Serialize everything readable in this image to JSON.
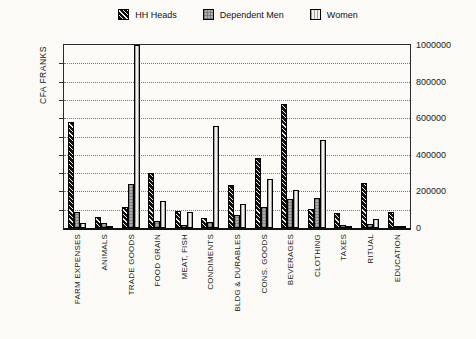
{
  "page": {
    "background": "#fbfaf7"
  },
  "legend": {
    "position": "top-center",
    "items": [
      {
        "label": "HH Heads",
        "swatch": "black-diagonal-hatch"
      },
      {
        "label": "Dependent Men",
        "swatch": "gray-checker"
      },
      {
        "label": "Women",
        "swatch": "light-vertical-lines"
      }
    ]
  },
  "chart_data": {
    "type": "bar",
    "title": "",
    "ylabel": "CFA FRANKS",
    "xlabel": "",
    "ylim": [
      0,
      1000000
    ],
    "gridline_step": 100000,
    "ytick_label_step": 200000,
    "ytick_labels_side": "right",
    "grid": "horizontal-dotted",
    "legend_position": "top-center",
    "x_label_rotation": -90,
    "categories": [
      "FARM EXPENSES",
      "ANIMALS",
      "TRADE GOODS",
      "FOOD GRAIN",
      "MEAT, FISH",
      "CONDIMENTS",
      "BLDG & DURABLES",
      "CONS. GOODS",
      "BEVERAGES",
      "CLOTHING",
      "TAXES",
      "RITUAL",
      "EDUCATION"
    ],
    "series": [
      {
        "name": "HH Heads",
        "pattern": "black-diagonal-hatch",
        "values": [
          580000,
          60000,
          115000,
          300000,
          95000,
          55000,
          235000,
          380000,
          675000,
          105000,
          80000,
          245000,
          90000
        ]
      },
      {
        "name": "Dependent Men",
        "pattern": "gray-checker",
        "values": [
          85000,
          30000,
          240000,
          40000,
          18000,
          35000,
          70000,
          115000,
          160000,
          165000,
          15000,
          20000,
          8000
        ]
      },
      {
        "name": "Women",
        "pattern": "light-vertical-lines",
        "values": [
          25000,
          10000,
          1000000,
          150000,
          85000,
          560000,
          130000,
          270000,
          205000,
          480000,
          8000,
          48000,
          5000
        ]
      }
    ]
  },
  "colors": {
    "axis": "#2a2a2a",
    "grid": "#777777",
    "text": "#1a1a1a",
    "bar_dark": "#101010",
    "bar_gray": "#acacac",
    "bar_light": "#f1f0eb"
  }
}
